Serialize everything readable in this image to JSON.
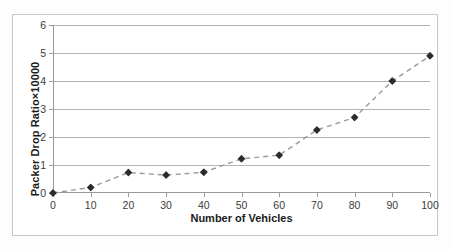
{
  "chart_data": {
    "type": "line",
    "title": "",
    "xlabel": "Number of Vehicles",
    "ylabel": "Packer Drop Ratio×10000",
    "x": [
      0,
      10,
      20,
      30,
      40,
      50,
      60,
      70,
      80,
      90,
      100
    ],
    "values": [
      0,
      0.2,
      0.73,
      0.64,
      0.74,
      1.22,
      1.35,
      2.25,
      2.7,
      4.0,
      4.9
    ],
    "series": [
      {
        "name": "Packer Drop Ratio",
        "values": [
          0,
          0.2,
          0.73,
          0.64,
          0.74,
          1.22,
          1.35,
          2.25,
          2.7,
          4.0,
          4.9
        ]
      }
    ],
    "xticks": [
      "0",
      "10",
      "20",
      "30",
      "40",
      "50",
      "60",
      "70",
      "80",
      "90",
      "100"
    ],
    "yticks": [
      "0",
      "1",
      "2",
      "3",
      "4",
      "5",
      "6"
    ],
    "xlim": [
      0,
      100
    ],
    "ylim": [
      0,
      6
    ],
    "grid": "horizontal",
    "legend": "none",
    "line_style": "dashed",
    "marker": "diamond",
    "colors": {
      "line": "#9a9a9a",
      "marker": "#2b2b2b",
      "grid": "#b4b4b4",
      "axis": "#9a9a9a",
      "frame": "#c8c8c8",
      "text": "#1b1b1b",
      "background": "#ffffff"
    }
  }
}
